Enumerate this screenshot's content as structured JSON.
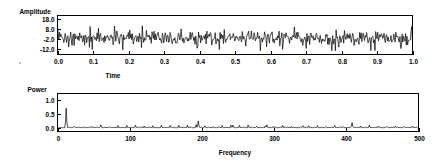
{
  "figure": {
    "background_color": "#ffffff",
    "ink_color": "#000000"
  },
  "chart_data": [
    {
      "type": "line",
      "id": "time-series",
      "title": "",
      "ylabel": "Amplitude",
      "xlabel": "Time",
      "xlim": [
        0.0,
        1.0
      ],
      "ylim": [
        -17.0,
        21.0
      ],
      "grid": false,
      "legend": null,
      "yticks": [
        18.0,
        8.0,
        -2.0,
        -12.0
      ],
      "ytick_labels": [
        "18.0",
        "8.0",
        "-2.0",
        "-12.0"
      ],
      "xticks": [
        0.0,
        0.1,
        0.2,
        0.3,
        0.4,
        0.5,
        0.6,
        0.7,
        0.8,
        0.9,
        1.0
      ],
      "xtick_labels": [
        "0.0",
        "0.1",
        "0.2",
        "0.3",
        "0.4",
        "0.5",
        "0.6",
        "0.7",
        "0.8",
        "0.9",
        "1.0"
      ],
      "description": "Dense broadband noise time series oscillating about a mean near -1, peak-to-peak roughly -12 to 10, with a large initial transient near t=0 reaching about 9.",
      "series": [
        {
          "name": "amplitude",
          "n_points": 512,
          "mean": -1.0,
          "noise_std": 3.4,
          "spike_rate": 0.16,
          "spike_scale": 2.1,
          "initial_transient": 9.0,
          "seed": 20114
        }
      ]
    },
    {
      "type": "line",
      "id": "power-spectrum",
      "title": "",
      "ylabel": "Power",
      "xlabel": "Frequency",
      "xlim": [
        0,
        500
      ],
      "ylim": [
        -0.12,
        1.25
      ],
      "grid": false,
      "legend": null,
      "yticks": [
        1.0,
        0.5,
        0.0
      ],
      "ytick_labels": [
        "1.0",
        "0.5",
        "0.0"
      ],
      "xticks": [
        0,
        100,
        200,
        300,
        400,
        500
      ],
      "xtick_labels": [
        "0",
        "100",
        "200",
        "300",
        "400",
        "500"
      ],
      "description": "Power spectrum: a dominant narrow peak near frequency 12 reaching about 0.72, a secondary peak near 195 at about 0.26, a smaller peak near 408 at about 0.20, and a dense low-level floor of harmonic spikes around 0.02-0.12 across the band.",
      "series": [
        {
          "name": "power",
          "n_points": 500,
          "baseline": 0.015,
          "floor_noise_std": 0.012,
          "comb_spacing": 12,
          "comb_height": 0.07,
          "seed": 7731,
          "peaks": [
            {
              "frequency": 12,
              "power": 0.72
            },
            {
              "frequency": 195,
              "power": 0.26
            },
            {
              "frequency": 408,
              "power": 0.2
            },
            {
              "frequency": 60,
              "power": 0.12
            },
            {
              "frequency": 108,
              "power": 0.11
            },
            {
              "frequency": 156,
              "power": 0.1
            },
            {
              "frequency": 243,
              "power": 0.11
            },
            {
              "frequency": 290,
              "power": 0.12
            },
            {
              "frequency": 340,
              "power": 0.09
            }
          ]
        }
      ]
    }
  ],
  "panels": {
    "top": {
      "ylabel": "Amplitude",
      "xlabel": "Time",
      "ytick_labels": [
        "18.0",
        "8.0",
        "-2.0",
        "-12.0"
      ],
      "xtick_labels": [
        "0.0",
        "0.1",
        "0.2",
        "0.3",
        "0.4",
        "0.5",
        "0.6",
        "0.7",
        "0.8",
        "0.9",
        "1.0"
      ]
    },
    "bottom": {
      "ylabel": "Power",
      "xlabel": "Frequency",
      "ytick_labels": [
        "1.0",
        "0.5",
        "0.0"
      ],
      "xtick_labels": [
        "0",
        "100",
        "200",
        "300",
        "400",
        "500"
      ]
    }
  }
}
